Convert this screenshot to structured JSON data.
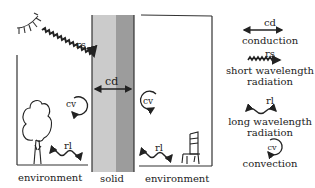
{
  "diagram": {
    "labels": {
      "rs": "rs",
      "cd": "cd",
      "cv_left": "cv",
      "cv_right": "cv",
      "rl_left": "rl",
      "rl_right": "rl",
      "environment_left": "environment",
      "solid": "solid",
      "environment_right": "environment"
    },
    "icons": [
      "sun-icon",
      "tree-icon",
      "chair-icon"
    ],
    "colors": {
      "solid_light": "#c9c9c9",
      "solid_dark": "#9a9a9a",
      "line": "#333333"
    }
  },
  "legend": {
    "items": [
      {
        "symbol": "cd",
        "name": "conduction",
        "icon": "double-arrow-icon"
      },
      {
        "symbol": "rs",
        "name": "short wavelength radiation",
        "line1": "short wavelength",
        "line2": "radiation",
        "icon": "zigzag-arrow-icon"
      },
      {
        "symbol": "rl",
        "name": "long wavelength radiation",
        "line1": "long wavelength",
        "line2": "radiation",
        "icon": "wave-double-arrow-icon"
      },
      {
        "symbol": "cv",
        "name": "convection",
        "icon": "circular-arrow-icon"
      }
    ]
  }
}
